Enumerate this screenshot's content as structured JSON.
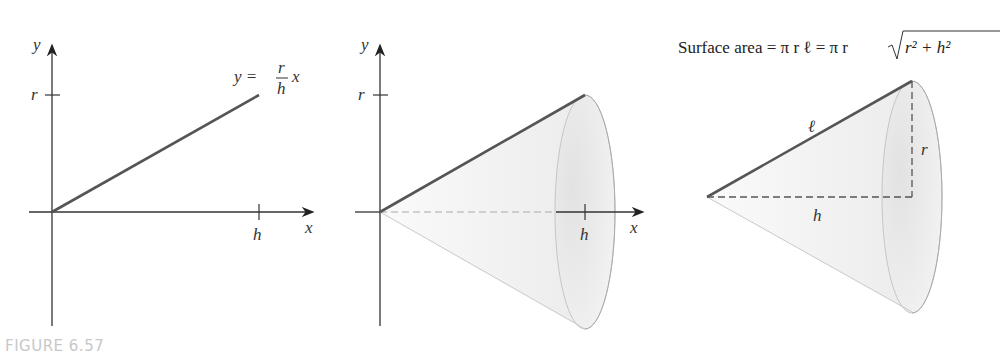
{
  "figure": {
    "caption": "FIGURE 6.57",
    "panel1": {
      "y_axis_label": "y",
      "x_axis_label": "x",
      "tick_r_label": "r",
      "tick_h_label": "h",
      "equation": {
        "lhs": "y =",
        "num": "r",
        "den": "h",
        "var": "x"
      }
    },
    "panel2": {
      "y_axis_label": "y",
      "x_axis_label": "x",
      "tick_r_label": "r",
      "tick_h_label": "h"
    },
    "panel3": {
      "formula_text": "Surface area = π r ℓ = π r",
      "radicand": "r² + h²",
      "slant_label": "ℓ",
      "radius_label": "r",
      "height_label": "h"
    }
  },
  "colors": {
    "axis": "#333333",
    "line": "#555555",
    "cone_fill": "#f2f2f2",
    "base_fill": "#dedede",
    "caption": "#c8c8c8"
  }
}
